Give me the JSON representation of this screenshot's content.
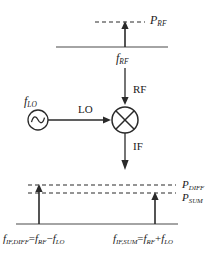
{
  "figure": {
    "stroke_color": "#1a1a1a",
    "background": "#ffffff"
  },
  "rf_input_spectrum": {
    "axis_label": "f",
    "axis_label_sub": "RF",
    "power_label": "P",
    "power_label_sub": "RF",
    "baseline_y": 47,
    "tone_x": 125,
    "tone_top_y": 22
  },
  "mixer": {
    "symbol": "multiplier-circle-x",
    "rf_port_label": "RF",
    "lo_port_label": "LO",
    "if_port_label": "IF",
    "center_x": 125,
    "center_y": 120,
    "radius": 13
  },
  "lo_source": {
    "symbol": "sine-source-circle",
    "freq_label": "f",
    "freq_label_sub": "LO",
    "center_x": 38,
    "center_y": 120,
    "radius": 10
  },
  "if_output_spectrum": {
    "baseline_y": 224,
    "diff_tone_x": 39,
    "sum_tone_x": 155,
    "diff_level_y": 185,
    "sum_level_y": 193,
    "power_diff_label": "P",
    "power_diff_sub": "DIFF",
    "power_sum_label": "P",
    "power_sum_sub": "SUM",
    "diff_formula": {
      "lhs_base": "f",
      "lhs_sub": "IF,DIFF",
      "equals": "=",
      "rhs_1_base": "f",
      "rhs_1_sub": "RF",
      "operator": "−",
      "rhs_2_base": "f",
      "rhs_2_sub": "LO"
    },
    "sum_formula": {
      "lhs_base": "f",
      "lhs_sub": "IF,SUM",
      "equals": "=",
      "rhs_1_base": "f",
      "rhs_1_sub": "RF",
      "operator": "+",
      "rhs_2_base": "f",
      "rhs_2_sub": "LO"
    }
  }
}
